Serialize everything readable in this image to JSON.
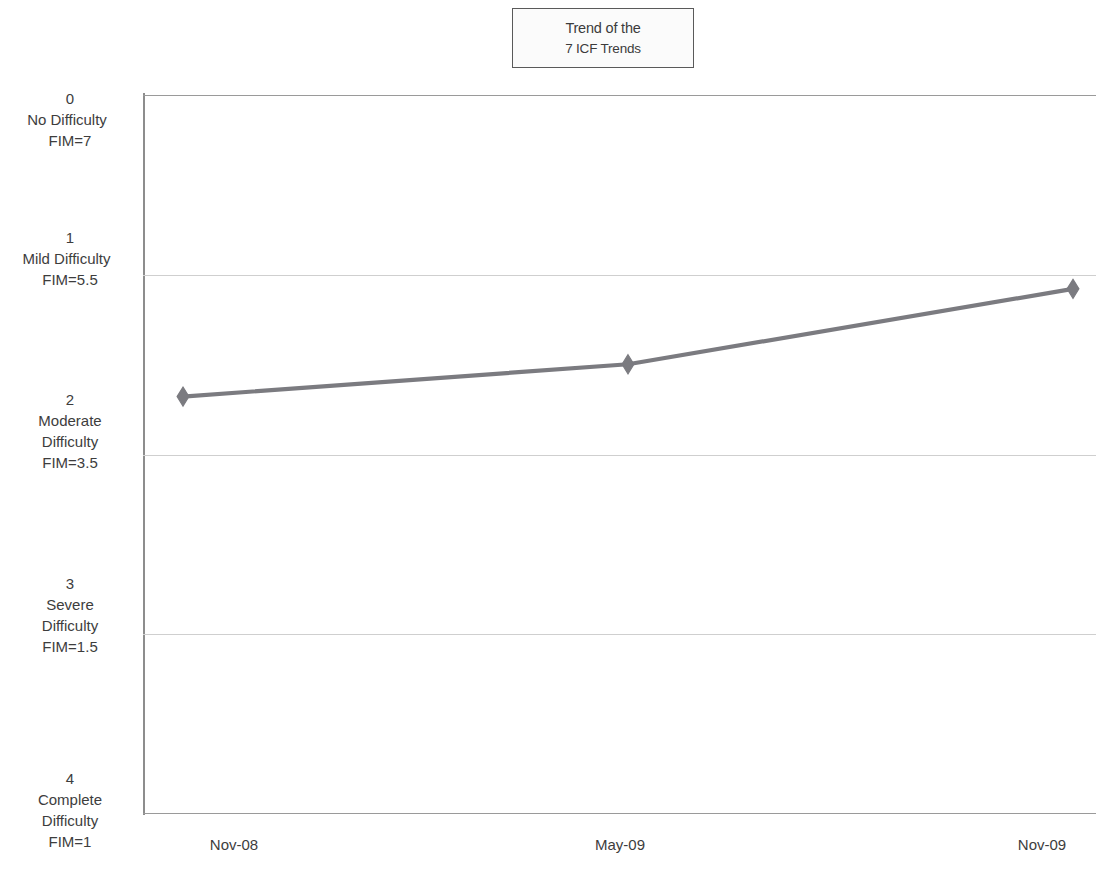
{
  "chart_data": {
    "type": "line",
    "title": "Trend of the 7 ICF Trends",
    "title_lines": [
      "Trend of the",
      "7 ICF Trends"
    ],
    "xlabel": "",
    "ylabel": "",
    "x": [
      "Nov-08",
      "May-09",
      "Nov-09"
    ],
    "categories": [
      "Nov-08",
      "May-09",
      "Nov-09"
    ],
    "series": [
      {
        "name": "7 ICF Trends",
        "values": [
          1.68,
          1.5,
          1.08
        ],
        "color": "#7b7b80",
        "marker": "diamond"
      }
    ],
    "ylim": [
      0,
      4
    ],
    "y_inverted": true,
    "y_ticks": [
      0,
      1,
      2,
      3,
      4
    ],
    "grid": true,
    "gridlines": [
      0,
      1,
      2,
      3,
      4
    ],
    "legend": "none",
    "y_tick_labels": [
      {
        "value": 0,
        "lines": [
          "0",
          "No Difficulty",
          "FIM=7"
        ]
      },
      {
        "value": 1,
        "lines": [
          "1",
          "Mild Difficulty",
          "FIM=5.5"
        ]
      },
      {
        "value": 2,
        "lines": [
          "2",
          "Moderate",
          "Difficulty",
          "FIM=3.5"
        ]
      },
      {
        "value": 3,
        "lines": [
          "3",
          "Severe",
          "Difficulty",
          "FIM=1.5"
        ]
      },
      {
        "value": 4,
        "lines": [
          "4",
          "Complete",
          "Difficulty",
          "FIM=1"
        ]
      }
    ]
  },
  "title": {
    "line1": "Trend of the",
    "line2": "7 ICF Trends"
  },
  "y_axis": {
    "t0_l1": "0",
    "t0_l2": "No Difficulty",
    "t0_l3": "FIM=7",
    "t1_l1": "1",
    "t1_l2": "Mild Difficulty",
    "t1_l3": "FIM=5.5",
    "t2_l1": "2",
    "t2_l2": "Moderate",
    "t2_l3": "Difficulty",
    "t2_l4": "FIM=3.5",
    "t3_l1": "3",
    "t3_l2": "Severe",
    "t3_l3": "Difficulty",
    "t3_l4": "FIM=1.5",
    "t4_l1": "4",
    "t4_l2": "Complete",
    "t4_l3": "Difficulty",
    "t4_l4": "FIM=1"
  },
  "x_axis": {
    "tick1": "Nov-08",
    "tick2": "May-09",
    "tick3": "Nov-09"
  },
  "colors": {
    "series": "#7b7b80",
    "grid": "#cfcfcf",
    "axis": "#8d8d8d",
    "text": "#3d3d3d",
    "title_border": "#5a5a5a",
    "title_bg": "#fbfbfb"
  }
}
